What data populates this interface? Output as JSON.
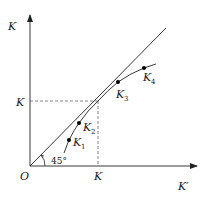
{
  "diagram": {
    "type": "economics-capital-convergence",
    "axes": {
      "y_label": "K",
      "x_label": "K′",
      "origin_label": "O"
    },
    "reference_line": {
      "angle_label": "45°",
      "description": "45-degree line"
    },
    "steady_state": {
      "y_label": "K",
      "x_label": "K"
    },
    "points": [
      {
        "name": "K",
        "sub": "1"
      },
      {
        "name": "K",
        "sub": "2"
      },
      {
        "name": "K",
        "sub": "3"
      },
      {
        "name": "K",
        "sub": "4"
      }
    ],
    "colors": {
      "line": "#222222",
      "dashed": "#555555",
      "background": "#ffffff"
    }
  }
}
